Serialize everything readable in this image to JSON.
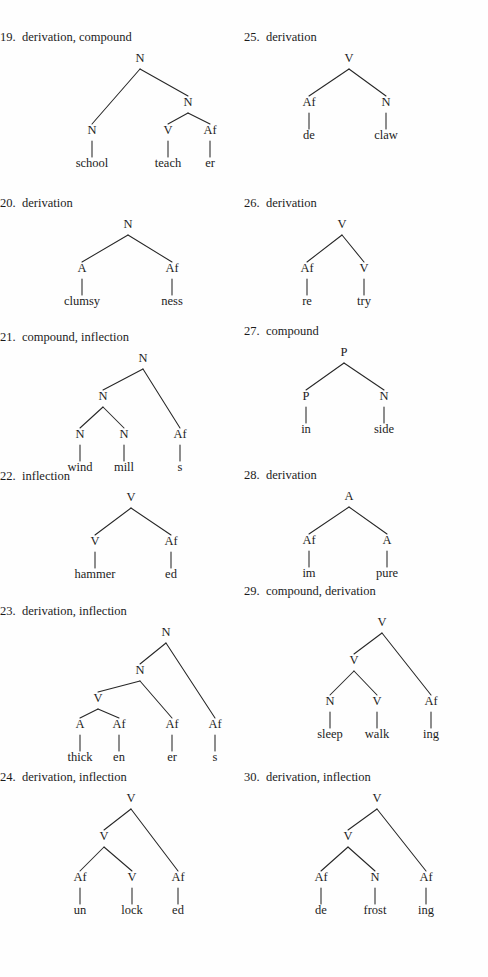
{
  "page": {
    "domain_note": "linguistics textbook answer key page, morphological tree diagrams",
    "background_color": "#fefefe",
    "text_color": "#1c1c1c",
    "line_color": "#262626",
    "columns": 2
  },
  "exercises": [
    {
      "number": "19.",
      "label": "derivation, compound",
      "column": "left",
      "top": 30,
      "tree": {
        "width": 244,
        "height": 150,
        "nodes": [
          {
            "id": "r",
            "text": "N",
            "x": 140,
            "y": 18
          },
          {
            "id": "a",
            "text": "N",
            "x": 92,
            "y": 90
          },
          {
            "id": "b",
            "text": "N",
            "x": 188,
            "y": 62
          },
          {
            "id": "c",
            "text": "V",
            "x": 168,
            "y": 90
          },
          {
            "id": "d",
            "text": "Af",
            "x": 210,
            "y": 90
          }
        ],
        "leaves": [
          {
            "id": "l1",
            "text": "school",
            "x": 92,
            "y": 123,
            "parent": "a"
          },
          {
            "id": "l2",
            "text": "teach",
            "x": 168,
            "y": 123,
            "parent": "c"
          },
          {
            "id": "l3",
            "text": "er",
            "x": 210,
            "y": 123,
            "parent": "d"
          }
        ],
        "edges": [
          {
            "from": "r",
            "to": "a"
          },
          {
            "from": "r",
            "to": "b"
          },
          {
            "from": "b",
            "to": "c"
          },
          {
            "from": "b",
            "to": "d"
          }
        ]
      }
    },
    {
      "number": "20.",
      "label": "derivation",
      "column": "left",
      "top": 196,
      "tree": {
        "width": 244,
        "height": 118,
        "nodes": [
          {
            "id": "r",
            "text": "N",
            "x": 128,
            "y": 18
          },
          {
            "id": "a",
            "text": "A",
            "x": 82,
            "y": 62
          },
          {
            "id": "b",
            "text": "Af",
            "x": 172,
            "y": 62
          }
        ],
        "leaves": [
          {
            "id": "l1",
            "text": "clumsy",
            "x": 82,
            "y": 95,
            "parent": "a"
          },
          {
            "id": "l2",
            "text": "ness",
            "x": 172,
            "y": 95,
            "parent": "b"
          }
        ],
        "edges": [
          {
            "from": "r",
            "to": "a"
          },
          {
            "from": "r",
            "to": "b"
          }
        ]
      }
    },
    {
      "number": "21.",
      "label": "compound, inflection",
      "column": "left",
      "top": 330,
      "tree": {
        "width": 244,
        "height": 130,
        "nodes": [
          {
            "id": "r",
            "text": "N",
            "x": 143,
            "y": 18
          },
          {
            "id": "a",
            "text": "N",
            "x": 103,
            "y": 56
          },
          {
            "id": "b",
            "text": "Af",
            "x": 180,
            "y": 94
          },
          {
            "id": "c",
            "text": "N",
            "x": 80,
            "y": 94
          },
          {
            "id": "d",
            "text": "N",
            "x": 124,
            "y": 94
          }
        ],
        "leaves": [
          {
            "id": "l1",
            "text": "wind",
            "x": 80,
            "y": 127,
            "parent": "c"
          },
          {
            "id": "l2",
            "text": "mill",
            "x": 124,
            "y": 127,
            "parent": "d"
          },
          {
            "id": "l3",
            "text": "s",
            "x": 180,
            "y": 127,
            "parent": "b"
          }
        ],
        "edges": [
          {
            "from": "r",
            "to": "a"
          },
          {
            "from": "r",
            "to": "b"
          },
          {
            "from": "a",
            "to": "c"
          },
          {
            "from": "a",
            "to": "d"
          }
        ]
      }
    },
    {
      "number": "22.",
      "label": "inflection",
      "column": "left",
      "top": 469,
      "tree": {
        "width": 244,
        "height": 118,
        "nodes": [
          {
            "id": "r",
            "text": "V",
            "x": 131,
            "y": 18
          },
          {
            "id": "a",
            "text": "V",
            "x": 95,
            "y": 62
          },
          {
            "id": "b",
            "text": "Af",
            "x": 171,
            "y": 62
          }
        ],
        "leaves": [
          {
            "id": "l1",
            "text": "hammer",
            "x": 95,
            "y": 95,
            "parent": "a"
          },
          {
            "id": "l2",
            "text": "ed",
            "x": 171,
            "y": 95,
            "parent": "b"
          }
        ],
        "edges": [
          {
            "from": "r",
            "to": "a"
          },
          {
            "from": "r",
            "to": "b"
          }
        ]
      }
    },
    {
      "number": "23.",
      "label": "derivation, inflection",
      "column": "left",
      "top": 604,
      "tree": {
        "width": 244,
        "height": 150,
        "nodes": [
          {
            "id": "r",
            "text": "N",
            "x": 166,
            "y": 18
          },
          {
            "id": "a",
            "text": "N",
            "x": 140,
            "y": 56
          },
          {
            "id": "b",
            "text": "Af",
            "x": 215,
            "y": 110
          },
          {
            "id": "c",
            "text": "V",
            "x": 98,
            "y": 84
          },
          {
            "id": "d",
            "text": "Af",
            "x": 172,
            "y": 110
          },
          {
            "id": "e",
            "text": "A",
            "x": 80,
            "y": 110
          },
          {
            "id": "f",
            "text": "Af",
            "x": 119,
            "y": 110
          }
        ],
        "leaves": [
          {
            "id": "l1",
            "text": "thick",
            "x": 80,
            "y": 143,
            "parent": "e"
          },
          {
            "id": "l2",
            "text": "en",
            "x": 119,
            "y": 143,
            "parent": "f"
          },
          {
            "id": "l3",
            "text": "er",
            "x": 172,
            "y": 143,
            "parent": "d"
          },
          {
            "id": "l4",
            "text": "s",
            "x": 215,
            "y": 143,
            "parent": "b"
          }
        ],
        "edges": [
          {
            "from": "r",
            "to": "a"
          },
          {
            "from": "r",
            "to": "b"
          },
          {
            "from": "a",
            "to": "c"
          },
          {
            "from": "a",
            "to": "d"
          },
          {
            "from": "c",
            "to": "e"
          },
          {
            "from": "c",
            "to": "f"
          }
        ]
      }
    },
    {
      "number": "24.",
      "label": "derivation, inflection",
      "column": "left",
      "top": 770,
      "tree": {
        "width": 244,
        "height": 145,
        "nodes": [
          {
            "id": "r",
            "text": "V",
            "x": 131,
            "y": 18
          },
          {
            "id": "a",
            "text": "V",
            "x": 104,
            "y": 56
          },
          {
            "id": "b",
            "text": "Af",
            "x": 178,
            "y": 97
          },
          {
            "id": "c",
            "text": "Af",
            "x": 80,
            "y": 97
          },
          {
            "id": "d",
            "text": "V",
            "x": 132,
            "y": 97
          }
        ],
        "leaves": [
          {
            "id": "l1",
            "text": "un",
            "x": 80,
            "y": 130,
            "parent": "c"
          },
          {
            "id": "l2",
            "text": "lock",
            "x": 132,
            "y": 130,
            "parent": "d"
          },
          {
            "id": "l3",
            "text": "ed",
            "x": 178,
            "y": 130,
            "parent": "b"
          }
        ],
        "edges": [
          {
            "from": "r",
            "to": "a"
          },
          {
            "from": "r",
            "to": "b"
          },
          {
            "from": "a",
            "to": "c"
          },
          {
            "from": "a",
            "to": "d"
          }
        ]
      }
    },
    {
      "number": "25.",
      "label": "derivation",
      "column": "right",
      "top": 30,
      "tree": {
        "width": 244,
        "height": 118,
        "nodes": [
          {
            "id": "r",
            "text": "V",
            "x": 105,
            "y": 18
          },
          {
            "id": "a",
            "text": "Af",
            "x": 65,
            "y": 62
          },
          {
            "id": "b",
            "text": "N",
            "x": 142,
            "y": 62
          }
        ],
        "leaves": [
          {
            "id": "l1",
            "text": "de",
            "x": 65,
            "y": 95,
            "parent": "a"
          },
          {
            "id": "l2",
            "text": "claw",
            "x": 142,
            "y": 95,
            "parent": "b"
          }
        ],
        "edges": [
          {
            "from": "r",
            "to": "a"
          },
          {
            "from": "r",
            "to": "b"
          }
        ]
      }
    },
    {
      "number": "26.",
      "label": "derivation",
      "column": "right",
      "top": 196,
      "tree": {
        "width": 244,
        "height": 118,
        "nodes": [
          {
            "id": "r",
            "text": "V",
            "x": 98,
            "y": 18
          },
          {
            "id": "a",
            "text": "Af",
            "x": 63,
            "y": 62
          },
          {
            "id": "b",
            "text": "V",
            "x": 120,
            "y": 62
          }
        ],
        "leaves": [
          {
            "id": "l1",
            "text": "re",
            "x": 63,
            "y": 95,
            "parent": "a"
          },
          {
            "id": "l2",
            "text": "try",
            "x": 120,
            "y": 95,
            "parent": "b"
          }
        ],
        "edges": [
          {
            "from": "r",
            "to": "a"
          },
          {
            "from": "r",
            "to": "b"
          }
        ]
      }
    },
    {
      "number": "27.",
      "label": "compound",
      "column": "right",
      "top": 324,
      "tree": {
        "width": 244,
        "height": 118,
        "nodes": [
          {
            "id": "r",
            "text": "P",
            "x": 100,
            "y": 18
          },
          {
            "id": "a",
            "text": "P",
            "x": 62,
            "y": 62
          },
          {
            "id": "b",
            "text": "N",
            "x": 140,
            "y": 62
          }
        ],
        "leaves": [
          {
            "id": "l1",
            "text": "in",
            "x": 62,
            "y": 95,
            "parent": "a"
          },
          {
            "id": "l2",
            "text": "side",
            "x": 140,
            "y": 95,
            "parent": "b"
          }
        ],
        "edges": [
          {
            "from": "r",
            "to": "a"
          },
          {
            "from": "r",
            "to": "b"
          }
        ]
      }
    },
    {
      "number": "28.",
      "label": "derivation",
      "column": "right",
      "top": 468,
      "tree": {
        "width": 244,
        "height": 118,
        "nodes": [
          {
            "id": "r",
            "text": "A",
            "x": 105,
            "y": 18
          },
          {
            "id": "a",
            "text": "Af",
            "x": 65,
            "y": 62
          },
          {
            "id": "b",
            "text": "A",
            "x": 143,
            "y": 62
          }
        ],
        "leaves": [
          {
            "id": "l1",
            "text": "im",
            "x": 65,
            "y": 95,
            "parent": "a"
          },
          {
            "id": "l2",
            "text": "pure",
            "x": 143,
            "y": 95,
            "parent": "b"
          }
        ],
        "edges": [
          {
            "from": "r",
            "to": "a"
          },
          {
            "from": "r",
            "to": "b"
          }
        ]
      }
    },
    {
      "number": "29.",
      "label": "compound, derivation",
      "column": "right",
      "top": 584,
      "tree": {
        "width": 244,
        "height": 145,
        "nodes": [
          {
            "id": "r",
            "text": "V",
            "x": 138,
            "y": 28
          },
          {
            "id": "a",
            "text": "V",
            "x": 110,
            "y": 66
          },
          {
            "id": "b",
            "text": "Af",
            "x": 187,
            "y": 107
          },
          {
            "id": "c",
            "text": "N",
            "x": 86,
            "y": 107
          },
          {
            "id": "d",
            "text": "V",
            "x": 133,
            "y": 107
          }
        ],
        "leaves": [
          {
            "id": "l1",
            "text": "sleep",
            "x": 86,
            "y": 140,
            "parent": "c"
          },
          {
            "id": "l2",
            "text": "walk",
            "x": 133,
            "y": 140,
            "parent": "d"
          },
          {
            "id": "l3",
            "text": "ing",
            "x": 187,
            "y": 140,
            "parent": "b"
          }
        ],
        "edges": [
          {
            "from": "r",
            "to": "a"
          },
          {
            "from": "r",
            "to": "b"
          },
          {
            "from": "a",
            "to": "c"
          },
          {
            "from": "a",
            "to": "d"
          }
        ]
      }
    },
    {
      "number": "30.",
      "label": "derivation, inflection",
      "column": "right",
      "top": 770,
      "tree": {
        "width": 244,
        "height": 145,
        "nodes": [
          {
            "id": "r",
            "text": "V",
            "x": 133,
            "y": 18
          },
          {
            "id": "a",
            "text": "V",
            "x": 104,
            "y": 56
          },
          {
            "id": "b",
            "text": "Af",
            "x": 182,
            "y": 97
          },
          {
            "id": "c",
            "text": "Af",
            "x": 77,
            "y": 97
          },
          {
            "id": "d",
            "text": "N",
            "x": 131,
            "y": 97
          }
        ],
        "leaves": [
          {
            "id": "l1",
            "text": "de",
            "x": 77,
            "y": 130,
            "parent": "c"
          },
          {
            "id": "l2",
            "text": "frost",
            "x": 131,
            "y": 130,
            "parent": "d"
          },
          {
            "id": "l3",
            "text": "ing",
            "x": 182,
            "y": 130,
            "parent": "b"
          }
        ],
        "edges": [
          {
            "from": "r",
            "to": "a"
          },
          {
            "from": "r",
            "to": "b"
          },
          {
            "from": "a",
            "to": "c"
          },
          {
            "from": "a",
            "to": "d"
          }
        ]
      }
    }
  ]
}
